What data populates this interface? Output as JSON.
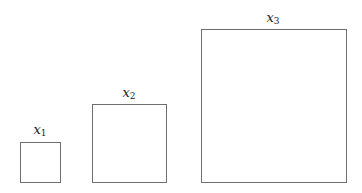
{
  "diagram": {
    "squares": [
      {
        "label_var": "x",
        "label_sub": "1"
      },
      {
        "label_var": "x",
        "label_sub": "2"
      },
      {
        "label_var": "x",
        "label_sub": "3"
      }
    ]
  }
}
